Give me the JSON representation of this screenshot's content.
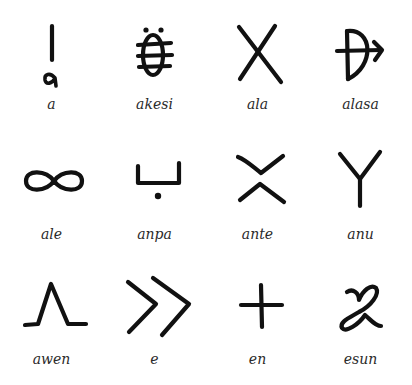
{
  "glyphs": [
    {
      "word": "a",
      "icon": "a-glyph-icon"
    },
    {
      "word": "akesi",
      "icon": "akesi-glyph-icon"
    },
    {
      "word": "ala",
      "icon": "ala-glyph-icon"
    },
    {
      "word": "alasa",
      "icon": "alasa-glyph-icon"
    },
    {
      "word": "ale",
      "icon": "ale-glyph-icon"
    },
    {
      "word": "anpa",
      "icon": "anpa-glyph-icon"
    },
    {
      "word": "ante",
      "icon": "ante-glyph-icon"
    },
    {
      "word": "anu",
      "icon": "anu-glyph-icon"
    },
    {
      "word": "awen",
      "icon": "awen-glyph-icon"
    },
    {
      "word": "e",
      "icon": "e-glyph-icon"
    },
    {
      "word": "en",
      "icon": "en-glyph-icon"
    },
    {
      "word": "esun",
      "icon": "esun-glyph-icon"
    }
  ],
  "ink_color": "#111111",
  "label_color": "#2a2a2a",
  "background": "#ffffff"
}
